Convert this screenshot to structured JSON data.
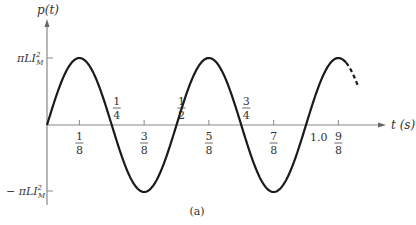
{
  "figure": {
    "caption": "(a)",
    "y_axis_label": "p(t)",
    "x_axis_label": "t (s)",
    "pos_level_label": "πLI²M",
    "neg_level_label": "− πLI²M",
    "colors": {
      "curve": "#1a1a1a",
      "axis": "#888888",
      "text": "#333333"
    }
  },
  "ticks_below": [
    {
      "num": "1",
      "den": "8",
      "t": 0.125
    },
    {
      "num": "3",
      "den": "8",
      "t": 0.375
    },
    {
      "num": "5",
      "den": "8",
      "t": 0.625
    },
    {
      "num": "7",
      "den": "8",
      "t": 0.875
    },
    {
      "num": "9",
      "den": "8",
      "t": 1.125
    }
  ],
  "zero_crossing_labels": [
    {
      "num": "1",
      "den": "4",
      "t": 0.25
    },
    {
      "num": "1",
      "den": "2",
      "t": 0.5
    },
    {
      "num": "3",
      "den": "4",
      "t": 0.75
    }
  ],
  "decimal_label": {
    "text": "1.0",
    "t": 1.0
  },
  "chart_data": {
    "type": "line",
    "title": "",
    "xlabel": "t (s)",
    "ylabel": "p(t)",
    "function": "p(t) = πLI²M sin(4πt)",
    "x": [
      0,
      0.125,
      0.25,
      0.375,
      0.5,
      0.625,
      0.75,
      0.875,
      1.0,
      1.125
    ],
    "values": [
      0,
      1,
      0,
      -1,
      0,
      1,
      0,
      -1,
      0,
      1
    ],
    "y_units": "πLI²M",
    "xlim": [
      0,
      1.2
    ],
    "ylim": [
      -1,
      1
    ],
    "continuation": "dashed after t ≈ 1.15",
    "grid": false,
    "legend": null
  }
}
